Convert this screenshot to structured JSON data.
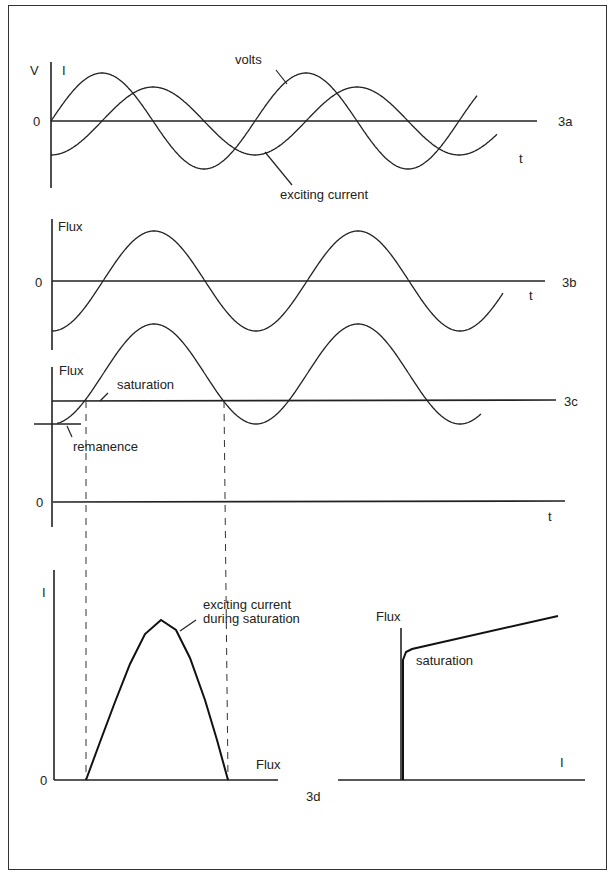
{
  "figure": {
    "panel_3a": {
      "tag": "3a",
      "y_axis_labels": [
        "V",
        "I"
      ],
      "zero_label": "0",
      "x_label": "t",
      "annotations": {
        "volts": "volts",
        "current": "exciting current"
      }
    },
    "panel_3b": {
      "tag": "3b",
      "y_label": "Flux",
      "zero_label": "0",
      "x_label": "t"
    },
    "panel_3c": {
      "tag": "3c",
      "y_label": "Flux",
      "zero_label": "0",
      "x_label": "t",
      "annotations": {
        "saturation": "saturation",
        "remanence": "remanence"
      }
    },
    "panel_3d": {
      "tag": "3d",
      "left": {
        "y_label": "I",
        "zero_label": "0",
        "x_label": "Flux",
        "annotation_line1": "exciting current",
        "annotation_line2": "during saturation"
      },
      "right": {
        "y_label": "Flux",
        "x_label": "I",
        "annotation": "saturation"
      }
    }
  },
  "chart_data": [
    {
      "type": "line",
      "title": "3a",
      "xlabel": "t",
      "ylabel": "V / I",
      "x_origin_px": 51,
      "zero_px": 121,
      "period_px": 204,
      "series": [
        {
          "name": "volts",
          "amplitude_px": 48,
          "phase": 0,
          "x_start": 51,
          "x_end": 477
        },
        {
          "name": "exciting current",
          "amplitude_px": 34,
          "phase": -90,
          "x_start": 51,
          "x_end": 497
        }
      ]
    },
    {
      "type": "line",
      "title": "3b",
      "xlabel": "t",
      "ylabel": "Flux",
      "x_origin_px": 52,
      "zero_px": 281,
      "period_px": 204,
      "series": [
        {
          "name": "flux",
          "amplitude_px": 50,
          "phase": -90,
          "x_start": 52,
          "x_end": 503
        }
      ]
    },
    {
      "type": "line",
      "title": "3c",
      "xlabel": "t",
      "ylabel": "Flux",
      "x_origin_px": 52,
      "zero_px": 502,
      "center_px": 374,
      "period_px": 204,
      "saturation_level_px": 401,
      "remanence_level_px": 424,
      "series": [
        {
          "name": "flux (offset by remanence)",
          "amplitude_px": 50,
          "phase": -90,
          "x_start": 57,
          "x_end": 481
        }
      ]
    },
    {
      "type": "line",
      "title": "3d (left)",
      "xlabel": "Flux",
      "ylabel": "I",
      "series": [
        {
          "name": "exciting current during saturation",
          "points": [
            [
              86,
              780
            ],
            [
              100,
              742
            ],
            [
              115,
              702
            ],
            [
              130,
              664
            ],
            [
              145,
              634
            ],
            [
              161,
              620
            ],
            [
              176,
              630
            ],
            [
              190,
              658
            ],
            [
              205,
              700
            ],
            [
              217,
              740
            ],
            [
              228,
              780
            ]
          ]
        }
      ]
    },
    {
      "type": "line",
      "title": "3d (right)",
      "xlabel": "I",
      "ylabel": "Flux",
      "series": [
        {
          "name": "magnetization curve",
          "points": [
            [
              403,
              780
            ],
            [
              403,
              660
            ],
            [
              406,
              652
            ],
            [
              412,
              649
            ],
            [
              558,
              616
            ]
          ]
        }
      ]
    }
  ]
}
